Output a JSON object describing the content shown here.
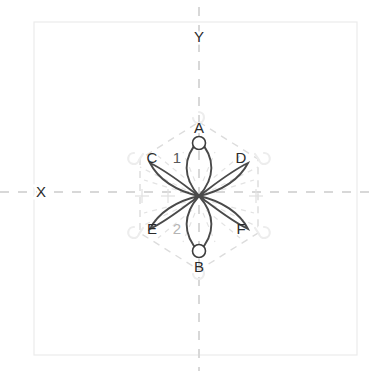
{
  "figure": {
    "title": "",
    "background_color": "#ffffff",
    "frame": {
      "name": "plot-frame",
      "x": 34,
      "y": 22,
      "width": 323,
      "height": 333,
      "stroke": "#ebebeb",
      "stroke_width": 1.2
    },
    "axes": {
      "x_axis": {
        "label": "X",
        "label_x": 41,
        "label_y": 197,
        "y": 192,
        "x_start": 0,
        "x_end": 378,
        "color": "#d8d8d8",
        "dash": "9 9",
        "stroke_width": 2.0
      },
      "y_axis": {
        "label": "Y",
        "label_x": 199,
        "label_y": 42,
        "x": 199,
        "y_start": 7,
        "y_end": 371,
        "color": "#d8d8d8",
        "dash": "9 9",
        "stroke_width": 2.0
      }
    },
    "center": {
      "x": 199,
      "y": 196
    },
    "colors": {
      "orbital_stroke": "#4a4a4a",
      "node_stroke": "#3d3d3d",
      "hex_dash": "#dcdcdc",
      "radial_dash": "#e0e0e0",
      "hook_glyph": "#ececec",
      "cross_marker": "#e2e2e2",
      "label_dark": "#2b2b2b",
      "label_mid": "#595959",
      "label_light": "#b4b4b4"
    },
    "orbitals": [
      {
        "id": "A",
        "name": "orbital-lobe-a",
        "direction": "up",
        "tip_x": 199,
        "tip_y": 142,
        "shape": "lobe"
      },
      {
        "id": "B",
        "name": "orbital-lobe-b",
        "direction": "down",
        "tip_x": 199,
        "tip_y": 252,
        "shape": "lobe"
      },
      {
        "id": "C",
        "name": "orbital-lobe-c",
        "direction": "upper-left",
        "tip_x": 152,
        "tip_y": 163,
        "shape": "crescent"
      },
      {
        "id": "D",
        "name": "orbital-lobe-d",
        "direction": "upper-right",
        "tip_x": 246,
        "tip_y": 163,
        "shape": "crescent"
      },
      {
        "id": "E",
        "name": "orbital-lobe-e",
        "direction": "lower-left",
        "tip_x": 152,
        "tip_y": 229,
        "shape": "crescent"
      },
      {
        "id": "F",
        "name": "orbital-lobe-f",
        "direction": "lower-right",
        "tip_x": 246,
        "tip_y": 229,
        "shape": "crescent"
      }
    ],
    "nodes": [
      {
        "id": "node-a",
        "name": "atom-node-a",
        "cx": 199,
        "cy": 143,
        "r": 6.5
      },
      {
        "id": "node-b",
        "name": "atom-node-b",
        "cx": 199,
        "cy": 251,
        "r": 6.5
      }
    ],
    "vertex_labels": [
      {
        "id": "A",
        "text": "A",
        "x": 199,
        "y": 133,
        "anchor": "middle",
        "tone": "dark"
      },
      {
        "id": "B",
        "text": "B",
        "x": 199,
        "y": 272,
        "anchor": "middle",
        "tone": "dark"
      },
      {
        "id": "C",
        "text": "C",
        "x": 152,
        "y": 163,
        "anchor": "middle",
        "tone": "dark"
      },
      {
        "id": "D",
        "text": "D",
        "x": 241,
        "y": 163,
        "anchor": "middle",
        "tone": "dark"
      },
      {
        "id": "E",
        "text": "E",
        "x": 152,
        "y": 234,
        "anchor": "middle",
        "tone": "dark"
      },
      {
        "id": "F",
        "text": "F",
        "x": 241,
        "y": 234,
        "anchor": "middle",
        "tone": "dark"
      }
    ],
    "index_labels": [
      {
        "id": "1",
        "text": "1",
        "x": 177,
        "y": 163,
        "anchor": "middle",
        "tone": "mid"
      },
      {
        "id": "2",
        "text": "2",
        "x": 177,
        "y": 234,
        "anchor": "middle",
        "tone": "light"
      }
    ],
    "hexagon": {
      "name": "coordination-hexagon",
      "points": "199,122 258,159 258,233 199,270 140,233 140,159",
      "stroke": "#dcdcdc",
      "dash": "7 6",
      "stroke_width": 1.4
    },
    "hex_vertices": [
      {
        "name": "hex-vertex-top",
        "x": 199,
        "y": 122,
        "hook": "none"
      },
      {
        "name": "hex-vertex-upper-right",
        "x": 258,
        "y": 159,
        "hook": "right"
      },
      {
        "name": "hex-vertex-lower-right",
        "x": 258,
        "y": 233,
        "hook": "right"
      },
      {
        "name": "hex-vertex-bottom",
        "x": 199,
        "y": 270,
        "hook": "none"
      },
      {
        "name": "hex-vertex-lower-left",
        "x": 140,
        "y": 233,
        "hook": "left"
      },
      {
        "name": "hex-vertex-upper-left",
        "x": 140,
        "y": 159,
        "hook": "left"
      }
    ],
    "cross_markers": [
      {
        "name": "cross-marker-left",
        "x": 142,
        "y": 196,
        "size": 7
      },
      {
        "name": "cross-marker-inner",
        "x": 168,
        "y": 196,
        "size": 7
      },
      {
        "name": "cross-marker-right",
        "x": 256,
        "y": 196,
        "size": 7
      }
    ],
    "radial_dashes": {
      "name": "radial-guide-lines",
      "count": 16,
      "stroke": "#e2e2e2",
      "dash": "5 5",
      "stroke_width": 1.2,
      "inner_radius": 14,
      "outer_radius": 62
    }
  }
}
